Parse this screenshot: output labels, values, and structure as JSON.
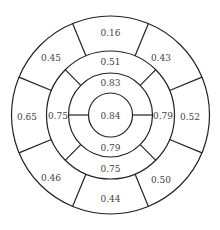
{
  "diagram": {
    "type": "bullseye",
    "center": {
      "x": 110.5,
      "y": 115
    },
    "radii": {
      "core": 22,
      "inner": 42,
      "middle": 64,
      "outer": 99
    },
    "stroke_color": "#222222",
    "label_color": "#444444",
    "core": {
      "value": "0.84"
    },
    "inner_ring": [
      {
        "position": "top",
        "value": "0.83"
      },
      {
        "position": "bottom",
        "value": "0.79"
      }
    ],
    "middle_ring": [
      {
        "position": "top",
        "value": "0.51"
      },
      {
        "position": "right",
        "value": "0.79"
      },
      {
        "position": "bottom",
        "value": "0.75"
      },
      {
        "position": "left",
        "value": "0.75"
      }
    ],
    "outer_ring": [
      {
        "position": "top",
        "value": "0.16"
      },
      {
        "position": "top-right",
        "value": "0.43"
      },
      {
        "position": "right",
        "value": "0.52"
      },
      {
        "position": "bottom-right",
        "value": "0.50"
      },
      {
        "position": "bottom",
        "value": "0.44"
      },
      {
        "position": "bottom-left",
        "value": "0.46"
      },
      {
        "position": "left",
        "value": "0.65"
      },
      {
        "position": "top-left",
        "value": "0.45"
      }
    ]
  }
}
